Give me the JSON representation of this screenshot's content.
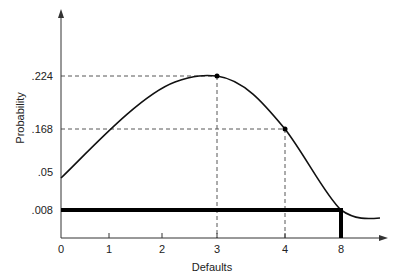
{
  "chart_data": {
    "type": "line",
    "title": "",
    "xlabel": "Defaults",
    "ylabel": "Probability",
    "x_ticks": [
      "0",
      "1",
      "2",
      "3",
      "4",
      "8"
    ],
    "y_ticks": [
      ".224",
      ".168",
      ".05",
      ".008"
    ],
    "series": [
      {
        "name": "probability curve",
        "points": [
          {
            "x": "0",
            "y": 0.04
          },
          {
            "x": "1",
            "y": 0.15
          },
          {
            "x": "2",
            "y": 0.205
          },
          {
            "x": "3",
            "y": 0.224
          },
          {
            "x": "4",
            "y": 0.168
          },
          {
            "x": "8",
            "y": 0.008
          }
        ]
      }
    ],
    "highlighted_points": [
      {
        "x": "3",
        "y": 0.224,
        "label": ".224"
      },
      {
        "x": "4",
        "y": 0.168,
        "label": ".168"
      }
    ],
    "threshold": {
      "x": "8",
      "y": 0.008,
      "label": ".008"
    },
    "grid": false,
    "legend": "none"
  }
}
